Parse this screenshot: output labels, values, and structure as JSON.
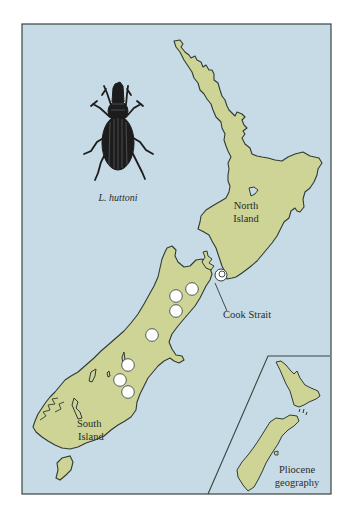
{
  "figure": {
    "species_label": "L. huttoni",
    "regions": [
      {
        "id": "north-island",
        "label_line1": "North",
        "label_line2": "Island"
      },
      {
        "id": "south-island",
        "label_line1": "South",
        "label_line2": "Island"
      }
    ],
    "callout": {
      "label": "Cook Strait"
    },
    "inset": {
      "label_line1": "Pliocene",
      "label_line2": "geography"
    },
    "occurrence_points": [
      {
        "x": 192,
        "y": 289
      },
      {
        "x": 176,
        "y": 296
      },
      {
        "x": 176,
        "y": 311
      },
      {
        "x": 152,
        "y": 335
      },
      {
        "x": 128,
        "y": 365
      },
      {
        "x": 120,
        "y": 380
      },
      {
        "x": 128,
        "y": 392
      },
      {
        "x": 221,
        "y": 275,
        "note": "Cook Strait"
      }
    ],
    "colors": {
      "water": "#c6dbe6",
      "land": "#cdd495",
      "outline": "#2f3a36",
      "point_fill": "#ffffff",
      "text": "#2b2b2b"
    }
  }
}
